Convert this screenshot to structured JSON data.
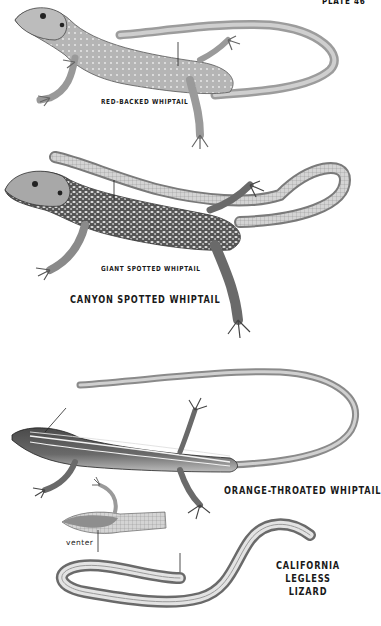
{
  "plate": {
    "number_label": "PLATE 46"
  },
  "species": [
    {
      "name": "RED-BACKED WHIPTAIL",
      "role": "subspecies label",
      "position": "top"
    },
    {
      "name": "GIANT SPOTTED WHIPTAIL",
      "role": "subspecies label",
      "position": "middle"
    },
    {
      "name": "CANYON SPOTTED WHIPTAIL",
      "role": "species title",
      "position": "middle"
    },
    {
      "name": "ORANGE-THROATED WHIPTAIL",
      "role": "species title",
      "position": "lower"
    },
    {
      "name": "CALIFORNIA LEGLESS LIZARD",
      "role": "species title",
      "position": "bottom"
    }
  ],
  "labels": {
    "red_backed": "RED-BACKED WHIPTAIL",
    "giant_spotted": "GIANT SPOTTED WHIPTAIL",
    "canyon_spotted": "CANYON SPOTTED WHIPTAIL",
    "orange_throated": "ORANGE-THROATED WHIPTAIL",
    "legless_line1": "CALIFORNIA",
    "legless_line2": "LEGLESS",
    "legless_line3": "LIZARD",
    "venter": "venter"
  },
  "colors": {
    "background": "#ffffff",
    "ink": "#1a1a1a",
    "body_light": "#c9c9c9",
    "body_mid": "#8a8a8a",
    "body_dark": "#3a3a3a"
  }
}
